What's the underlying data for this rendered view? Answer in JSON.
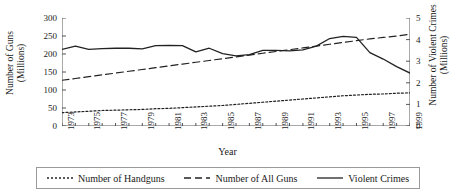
{
  "chart_data": {
    "type": "line",
    "title": "",
    "xlabel": "Year",
    "ylabel": "Number of Guns (Millions)",
    "ylabel_right": "Number of Violent Crimes (Millions)",
    "grid": false,
    "legend_position": "bottom",
    "xlim": [
      1973,
      1999
    ],
    "ylim": [
      0,
      300
    ],
    "ylim_right": [
      0,
      5
    ],
    "xticks": [
      1973,
      1975,
      1977,
      1979,
      1981,
      1983,
      1985,
      1987,
      1989,
      1991,
      1993,
      1995,
      1997,
      1999
    ],
    "xtick_labels": [
      "1973",
      "1975",
      "1977",
      "1979",
      "1981",
      "1983",
      "1985",
      "1987",
      "1989",
      "1991",
      "1993",
      "1995",
      "1997",
      "1999"
    ],
    "yticks": [
      0,
      50,
      100,
      150,
      200,
      250,
      300
    ],
    "ytick_labels": [
      "0",
      "50",
      "100",
      "150",
      "200",
      "250",
      "300"
    ],
    "yticks_right": [
      0,
      1,
      2,
      3,
      4,
      5
    ],
    "ytick_labels_right": [
      "0",
      "1",
      "2",
      "3",
      "4",
      "5"
    ],
    "x": [
      1973,
      1974,
      1975,
      1976,
      1977,
      1978,
      1979,
      1980,
      1981,
      1982,
      1983,
      1984,
      1985,
      1986,
      1987,
      1988,
      1989,
      1990,
      1991,
      1992,
      1993,
      1994,
      1995,
      1996,
      1997,
      1998,
      1999
    ],
    "series": [
      {
        "name": "Number of Handguns",
        "axis": "left",
        "style": "dotted",
        "color": "#222222",
        "values": [
          37,
          39,
          41,
          43,
          44,
          45,
          46,
          48,
          49,
          51,
          53,
          55,
          57,
          60,
          63,
          66,
          69,
          72,
          75,
          78,
          81,
          84,
          86,
          88,
          89,
          91,
          92
        ]
      },
      {
        "name": "Number of All Guns",
        "axis": "left",
        "style": "dashed",
        "color": "#222222",
        "values": [
          127,
          132,
          137,
          142,
          147,
          152,
          157,
          162,
          167,
          172,
          177,
          182,
          187,
          192,
          197,
          202,
          207,
          212,
          217,
          222,
          227,
          232,
          237,
          242,
          246,
          250,
          255
        ]
      },
      {
        "name": "Violent Crimes",
        "axis": "right",
        "style": "solid",
        "color": "#222222",
        "values": [
          3.55,
          3.7,
          3.55,
          3.58,
          3.6,
          3.6,
          3.57,
          3.72,
          3.73,
          3.72,
          3.43,
          3.6,
          3.35,
          3.25,
          3.3,
          3.5,
          3.5,
          3.48,
          3.52,
          3.7,
          4.05,
          4.15,
          4.1,
          3.4,
          3.1,
          2.75,
          2.45
        ]
      }
    ]
  },
  "legend": {
    "items": [
      {
        "label": "Number of Handguns",
        "style": "dotted"
      },
      {
        "label": "Number of All Guns",
        "style": "dashed"
      },
      {
        "label": "Violent Crimes",
        "style": "solid"
      }
    ]
  }
}
